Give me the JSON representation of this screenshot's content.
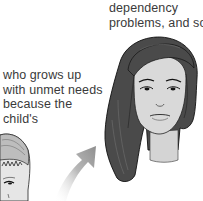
{
  "text_top": {
    "lines": [
      "dependency",
      "problems, and so"
    ]
  },
  "text_left": {
    "lines": [
      "who grows up",
      "with unmet needs",
      "because the",
      "child's"
    ]
  },
  "illustrations": {
    "child": "child-face-sketch",
    "arrow": "curved-arrow-up-right",
    "woman": "woman-face-sketch"
  },
  "colors": {
    "hair": "#4a4a4a",
    "skin": "#d6d6d6",
    "arrow": "#9a9a9a",
    "text": "#3a3a3a"
  }
}
